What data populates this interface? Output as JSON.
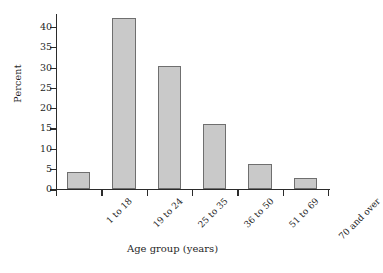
{
  "chart_data": {
    "type": "bar",
    "title": "",
    "subtitle": "",
    "xlabel": "Age group (years)",
    "ylabel": "Percent",
    "categories": [
      "1 to 18",
      "19 to 24",
      "25 to 35",
      "36 to 50",
      "51 to 69",
      "70 and over"
    ],
    "values": [
      4.2,
      42,
      30.3,
      15.8,
      6.1,
      2.5
    ],
    "ylim": [
      0,
      42
    ],
    "yticks": [
      0,
      5,
      10,
      15,
      20,
      25,
      30,
      35,
      40
    ],
    "ytick_labels": [
      "0",
      "5",
      "10",
      "15",
      "20",
      "25",
      "30",
      "35",
      "40"
    ],
    "grid": false,
    "legend": null,
    "annotations": []
  },
  "style": {
    "bar_fill": "#c9c9c9",
    "bar_edge": "#6f6f6f",
    "axis_color": "#2b2b2b",
    "text_color": "#1f1f1f",
    "background": "#ffffff"
  }
}
